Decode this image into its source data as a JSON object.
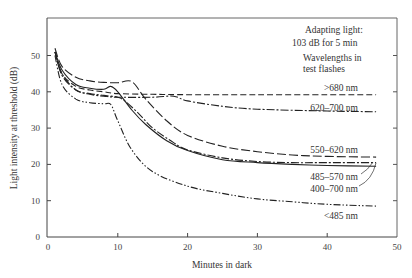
{
  "chart_data": {
    "type": "line",
    "title": "",
    "xlabel": "Minutes in dark",
    "ylabel": "Light intensity at threshold (dB)",
    "xlim": [
      0,
      50
    ],
    "ylim": [
      0,
      58
    ],
    "xticks": [
      0,
      10,
      20,
      30,
      40,
      50
    ],
    "yticks": [
      0,
      10,
      20,
      30,
      40,
      50
    ],
    "grid": false,
    "annotations": {
      "adapting_light_line1": "Adapting light:",
      "adapting_light_line2": "103 dB for 5 min",
      "wavelengths_line1": "Wavelengths in",
      "wavelengths_line2": "test flashes"
    },
    "series": [
      {
        "name": ">680 nm",
        "style": "dashed",
        "x": [
          1,
          2,
          4,
          6,
          8,
          10,
          15,
          20,
          30,
          40,
          47
        ],
        "y": [
          51,
          45,
          41.5,
          40.5,
          40,
          39.5,
          39.3,
          39.2,
          39.2,
          39.2,
          39.2
        ]
      },
      {
        "name": "620-700 nm",
        "style": "dash-dot",
        "x": [
          1,
          2,
          4,
          6,
          8,
          10,
          15,
          18,
          20,
          25,
          30,
          40,
          47
        ],
        "y": [
          51,
          44.5,
          40.5,
          39.3,
          38.8,
          38.5,
          38.5,
          38.8,
          37.5,
          36,
          35.2,
          34.7,
          34.5
        ]
      },
      {
        "name": "550-620 nm",
        "style": "long-dash",
        "x": [
          1,
          2,
          4,
          6,
          8,
          10,
          12,
          14,
          17,
          20,
          25,
          30,
          35,
          40,
          47
        ],
        "y": [
          52,
          47,
          44,
          43,
          42.6,
          42.5,
          42.8,
          38,
          32,
          28,
          25,
          23.5,
          22.6,
          22.2,
          22
        ]
      },
      {
        "name": "485-570 nm",
        "style": "dash-dot",
        "x": [
          1,
          2,
          4,
          6,
          8,
          10,
          11,
          13,
          15,
          18,
          20,
          25,
          30,
          35,
          40,
          47
        ],
        "y": [
          51,
          45,
          40.5,
          39.5,
          39,
          38.5,
          37.5,
          34,
          30,
          26,
          24,
          21.8,
          20.8,
          20.5,
          20.5,
          20.5
        ]
      },
      {
        "name": "400-700 nm",
        "style": "solid",
        "x": [
          1,
          2,
          4,
          6,
          8,
          9,
          10,
          12,
          14,
          17,
          20,
          25,
          30,
          35,
          40,
          47
        ],
        "y": [
          51,
          46,
          42,
          41,
          40.7,
          41.5,
          40,
          35,
          31,
          26.5,
          23.8,
          21.3,
          20.5,
          20,
          19.7,
          19.5
        ]
      },
      {
        "name": "<485 nm",
        "style": "dash-dot-dot",
        "x": [
          1,
          2,
          4,
          6,
          8,
          9,
          10,
          12,
          15,
          20,
          25,
          30,
          35,
          40,
          47
        ],
        "y": [
          50,
          42,
          38,
          37,
          36.7,
          36.5,
          32,
          24,
          18,
          14,
          12,
          10.5,
          9.7,
          9,
          8.5
        ]
      }
    ]
  },
  "labels": {
    "gt680": ">680 nm",
    "r620_700": "620–700 nm",
    "r550_620": "550–620 nm",
    "r485_570": "485–570 nm",
    "r400_700": "400–700 nm",
    "lt485": "<485 nm"
  }
}
